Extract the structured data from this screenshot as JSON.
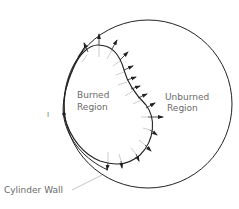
{
  "diagram": {
    "labels": {
      "burned": [
        "Burned",
        "Region"
      ],
      "unburned": [
        "Unburned",
        "Region"
      ],
      "cylinder_wall": "Cylinder Wall",
      "ignition": "I"
    },
    "colors": {
      "line": "#222222",
      "text": "#6a6a6a",
      "thin": "#9a9a9a"
    }
  }
}
